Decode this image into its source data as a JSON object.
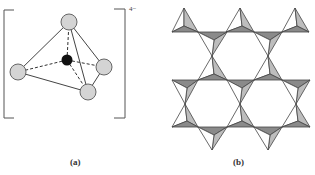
{
  "figure": {
    "panel_a": {
      "caption": "(a)",
      "charge": "4−",
      "description": "SiO4 tetrahedron",
      "atoms": {
        "center": {
          "x": 67,
          "y": 60,
          "r": 6,
          "fill": "#111111"
        },
        "outer": [
          {
            "x": 69,
            "y": 22,
            "r": 8
          },
          {
            "x": 18,
            "y": 72,
            "r": 8
          },
          {
            "x": 104,
            "y": 67,
            "r": 8
          },
          {
            "x": 88,
            "y": 92,
            "r": 8
          }
        ],
        "outer_fill": "#d4d4d4"
      }
    },
    "panel_b": {
      "caption": "(b)",
      "description": "Sheet of corner-sharing tetrahedra",
      "colors": {
        "dark": "#8a8a8a",
        "medium": "#bdbdbd",
        "light": "#ffffff"
      }
    }
  }
}
